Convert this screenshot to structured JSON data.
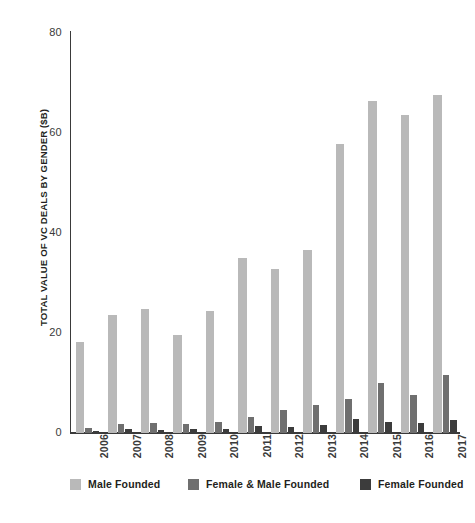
{
  "chart_data": {
    "type": "bar",
    "title": "",
    "subtitle": "",
    "xlabel": "",
    "ylabel": "TOTAL VALUE OF VC DEALS BY GENDER ($B)",
    "categories": [
      "2006",
      "2007",
      "2008",
      "2009",
      "2010",
      "2011",
      "2012",
      "2013",
      "2014",
      "2015",
      "2016",
      "2017"
    ],
    "ylim": [
      0,
      80
    ],
    "yticks": [
      0,
      20,
      40,
      60,
      80
    ],
    "ytick_labels": [
      "0",
      "20",
      "40",
      "60",
      "80"
    ],
    "grid": false,
    "legend_position": "bottom",
    "series": [
      {
        "name": "Male Founded",
        "color": "#b9b9b9",
        "values": [
          18.3,
          23.6,
          24.9,
          19.6,
          24.4,
          35.0,
          32.8,
          36.6,
          57.8,
          66.4,
          63.6,
          67.6
        ]
      },
      {
        "name": "Female & Male Founded",
        "color": "#6f6f6f",
        "values": [
          1.1,
          1.8,
          2.0,
          1.8,
          2.2,
          3.3,
          4.6,
          5.6,
          6.9,
          10.1,
          7.6,
          11.6
        ]
      },
      {
        "name": "Female Founded",
        "color": "#3c3c3c",
        "values": [
          0.4,
          0.9,
          0.7,
          0.8,
          0.9,
          1.4,
          1.2,
          1.7,
          2.8,
          2.2,
          2.1,
          2.7
        ]
      }
    ]
  },
  "legend": {
    "items": [
      {
        "label": "Male Founded",
        "color": "#b9b9b9"
      },
      {
        "label": "Female & Male Founded",
        "color": "#6f6f6f"
      },
      {
        "label": "Female Founded",
        "color": "#3c3c3c"
      }
    ]
  },
  "colors": {
    "male_founded": "#b9b9b9",
    "female_and_male_founded": "#6f6f6f",
    "female_founded": "#3c3c3c",
    "axis": "#3a3a3a",
    "text": "#231f20",
    "background": "#ffffff"
  }
}
